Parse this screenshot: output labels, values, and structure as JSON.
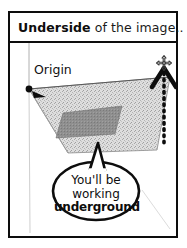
{
  "figure": {
    "title": {
      "emphasis": "Underside",
      "rest": " of the image.."
    },
    "labels": {
      "origin": "Origin"
    },
    "speech_bubble": {
      "line1": "You'll be",
      "line2": "working",
      "line3": "underground"
    },
    "icons": {
      "compass": "four-way-move-icon",
      "up_arrow": "dotted-up-arrow-icon",
      "origin_marker": "origin-dot-icon",
      "origin_pointer": "origin-arrow-icon"
    },
    "colors": {
      "ink": "#0d0d0d",
      "plane_fill": "#d9d9d9",
      "plane_inner_fill": "#8c8c8c",
      "axis_gray": "#b8b8b8",
      "paper": "#ffffff"
    }
  }
}
